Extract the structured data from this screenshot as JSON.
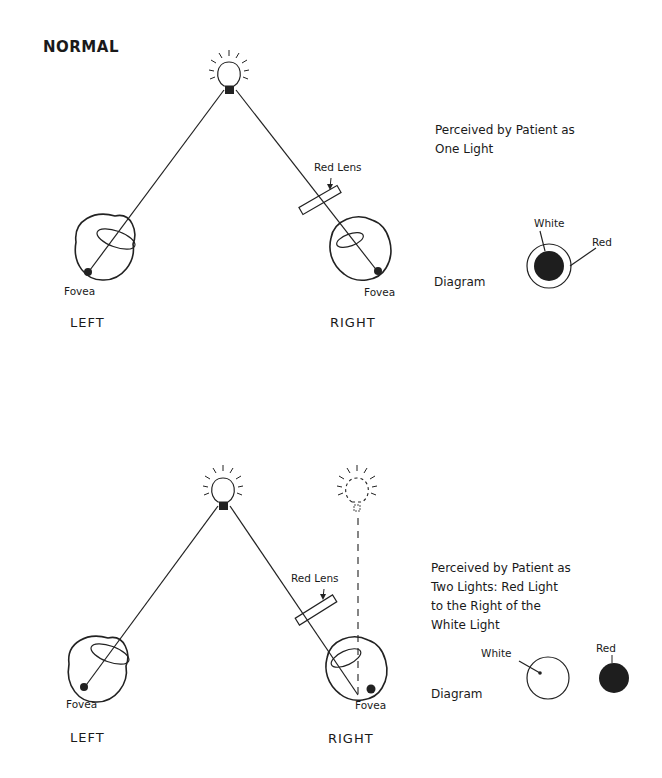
{
  "top_panel": {
    "title": "NORMAL",
    "left_eye_label": "LEFT",
    "right_eye_label": "RIGHT",
    "left_fovea": "Fovea",
    "right_fovea": "Fovea",
    "lens_label": "Red Lens",
    "perception_line1": "Perceived by Patient as",
    "perception_line2": "One Light",
    "diagram_label": "Diagram",
    "white_label": "White",
    "red_label": "Red"
  },
  "bottom_panel": {
    "left_eye_label": "LEFT",
    "right_eye_label": "RIGHT",
    "left_fovea": "Fovea",
    "right_fovea": "Fovea",
    "lens_label": "Red Lens",
    "perception_line1": "Perceived by Patient as",
    "perception_line2": "Two Lights: Red Light",
    "perception_line3": "to the Right of the",
    "perception_line4": "White Light",
    "diagram_label": "Diagram",
    "white_label": "White",
    "red_label": "Red"
  },
  "colors": {
    "ink": "#1a1a1a",
    "background": "#ffffff"
  }
}
